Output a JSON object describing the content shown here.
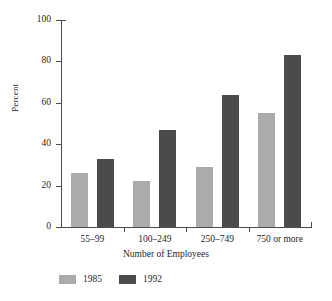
{
  "chart_data": {
    "type": "bar",
    "title": "",
    "xlabel": "Number of Employees",
    "ylabel": "Percent",
    "categories": [
      "55–99",
      "100–249",
      "250–749",
      "750 or more"
    ],
    "series": [
      {
        "name": "1985",
        "color": "#ababab",
        "values": [
          26,
          22,
          29,
          55
        ]
      },
      {
        "name": "1992",
        "color": "#4b4b4b",
        "values": [
          33,
          47,
          64,
          83
        ]
      }
    ],
    "ylim": [
      0,
      100
    ],
    "yticks": [
      0,
      20,
      40,
      60,
      80,
      100
    ],
    "ytick_labels": [
      "0",
      "20",
      "40",
      "60",
      "80",
      "100"
    ],
    "grid": false,
    "legend_position": "bottom-left"
  },
  "axes": {
    "y_label": "Percent",
    "x_label": "Number of Employees"
  },
  "legend": {
    "entries": [
      {
        "label": "1985",
        "swatch": "light-gray-swatch"
      },
      {
        "label": "1992",
        "swatch": "dark-gray-swatch"
      }
    ]
  }
}
